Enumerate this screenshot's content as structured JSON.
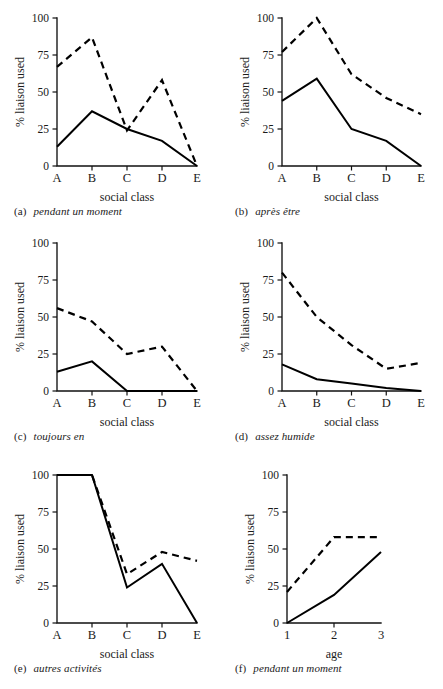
{
  "figure": {
    "panel_count": 6,
    "ylabel": "% liaison used",
    "y_ticks": [
      "0",
      "25",
      "50",
      "75",
      "100"
    ],
    "y_tick_values": [
      0,
      25,
      50,
      75,
      100
    ],
    "ylim": [
      0,
      100
    ]
  },
  "chart_data": [
    {
      "id": "panel-a",
      "type": "line",
      "title": "pendant un moment",
      "caption_tag": "(a)",
      "xlabel": "social class",
      "ylabel": "% liaison used",
      "categories": [
        "A",
        "B",
        "C",
        "D",
        "E"
      ],
      "ylim": [
        0,
        100
      ],
      "yticks": [
        0,
        25,
        50,
        75,
        100
      ],
      "grid": false,
      "legend": "none",
      "series": [
        {
          "name": "solid",
          "style": "solid",
          "values": [
            13,
            37,
            25,
            17,
            0
          ]
        },
        {
          "name": "dashed",
          "style": "dashed",
          "values": [
            67,
            87,
            24,
            58,
            0
          ]
        }
      ]
    },
    {
      "id": "panel-b",
      "type": "line",
      "title": "après être",
      "caption_tag": "(b)",
      "xlabel": "social class",
      "ylabel": "% liaison used",
      "categories": [
        "A",
        "B",
        "C",
        "D",
        "E"
      ],
      "ylim": [
        0,
        100
      ],
      "yticks": [
        0,
        25,
        50,
        75,
        100
      ],
      "grid": false,
      "legend": "none",
      "series": [
        {
          "name": "solid",
          "style": "solid",
          "values": [
            44,
            59,
            25,
            17,
            0
          ]
        },
        {
          "name": "dashed",
          "style": "dashed",
          "values": [
            77,
            100,
            62,
            46,
            35
          ]
        }
      ]
    },
    {
      "id": "panel-c",
      "type": "line",
      "title": "toujours en",
      "caption_tag": "(c)",
      "xlabel": "social class",
      "ylabel": "% liaison used",
      "categories": [
        "A",
        "B",
        "C",
        "D",
        "E"
      ],
      "ylim": [
        0,
        100
      ],
      "yticks": [
        0,
        25,
        50,
        75,
        100
      ],
      "grid": false,
      "legend": "none",
      "series": [
        {
          "name": "solid",
          "style": "solid",
          "values": [
            13,
            20,
            0,
            0,
            0
          ]
        },
        {
          "name": "dashed",
          "style": "dashed",
          "values": [
            56,
            47,
            25,
            30,
            0
          ]
        }
      ]
    },
    {
      "id": "panel-d",
      "type": "line",
      "title": "assez humide",
      "caption_tag": "(d)",
      "xlabel": "social class",
      "ylabel": "% liaison used",
      "categories": [
        "A",
        "B",
        "C",
        "D",
        "E"
      ],
      "ylim": [
        0,
        100
      ],
      "yticks": [
        0,
        25,
        50,
        75,
        100
      ],
      "grid": false,
      "legend": "none",
      "series": [
        {
          "name": "solid",
          "style": "solid",
          "values": [
            18,
            8,
            5,
            2,
            0
          ]
        },
        {
          "name": "dashed",
          "style": "dashed",
          "values": [
            80,
            50,
            31,
            15,
            19
          ]
        }
      ]
    },
    {
      "id": "panel-e",
      "type": "line",
      "title": "autres activités",
      "caption_tag": "(e)",
      "xlabel": "social class",
      "ylabel": "% liaison used",
      "categories": [
        "A",
        "B",
        "C",
        "D",
        "E"
      ],
      "ylim": [
        0,
        100
      ],
      "yticks": [
        0,
        25,
        50,
        75,
        100
      ],
      "grid": false,
      "legend": "none",
      "series": [
        {
          "name": "solid",
          "style": "solid",
          "values": [
            100,
            100,
            24,
            40,
            0
          ]
        },
        {
          "name": "dashed",
          "style": "dashed",
          "values": [
            100,
            100,
            33,
            48,
            42
          ]
        }
      ]
    },
    {
      "id": "panel-f",
      "type": "line",
      "title": "pendant un moment",
      "caption_tag": "(f)",
      "xlabel": "age",
      "ylabel": "% liaison used",
      "categories": [
        "1",
        "2",
        "3"
      ],
      "ylim": [
        0,
        100
      ],
      "yticks": [
        0,
        25,
        50,
        75,
        100
      ],
      "grid": false,
      "legend": "none",
      "series": [
        {
          "name": "solid",
          "style": "solid",
          "values": [
            0,
            19,
            48
          ]
        },
        {
          "name": "dashed",
          "style": "dashed",
          "values": [
            21,
            58,
            58
          ]
        }
      ]
    }
  ]
}
